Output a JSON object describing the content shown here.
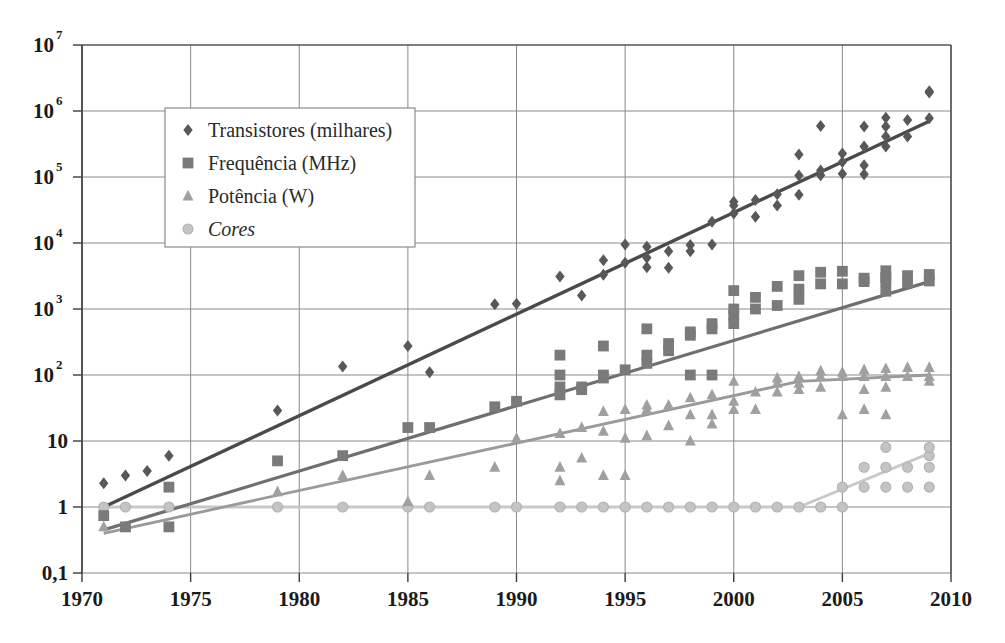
{
  "chart_data": {
    "type": "scatter",
    "title": "",
    "subtitle": "",
    "xlabel": "",
    "ylabel": "",
    "grid": true,
    "xlim": [
      1970,
      2010
    ],
    "ylim": [
      0.1,
      10000000
    ],
    "yscale": "log",
    "xticks": [
      "1970",
      "1975",
      "1980",
      "1985",
      "1990",
      "1995",
      "2000",
      "2005",
      "2010"
    ],
    "xtick_values": [
      1970,
      1975,
      1980,
      1985,
      1990,
      1995,
      2000,
      2005,
      2010
    ],
    "yticks": [
      "10⁷",
      "10⁶",
      "10⁵",
      "10⁴",
      "10³",
      "10²",
      "10",
      "1",
      "0,1"
    ],
    "ytick_values": [
      10000000,
      1000000,
      100000,
      10000,
      1000,
      100,
      10,
      1,
      0.1
    ],
    "ytick_bases": [
      "10",
      "10",
      "10",
      "10",
      "10",
      "10",
      "10",
      "1",
      "0,1"
    ],
    "ytick_exponents": [
      "7",
      "6",
      "5",
      "4",
      "3",
      "2",
      "",
      "",
      ""
    ],
    "legend_position": "upper-left",
    "series": [
      {
        "name": "Transistores (milhares)",
        "marker": "diamond",
        "color": "#585858",
        "trend_color": "#4a4a4a",
        "trend": [
          [
            1971,
            1.0
          ],
          [
            2009,
            700000
          ]
        ],
        "points": [
          [
            1971,
            2.3
          ],
          [
            1972,
            3.0
          ],
          [
            1973,
            3.5
          ],
          [
            1974,
            6.0
          ],
          [
            1979,
            29
          ],
          [
            1982,
            134
          ],
          [
            1985,
            275
          ],
          [
            1986,
            110
          ],
          [
            1989,
            1180
          ],
          [
            1990,
            1200
          ],
          [
            1992,
            3100
          ],
          [
            1993,
            1600
          ],
          [
            1994,
            3300
          ],
          [
            1994,
            5500
          ],
          [
            1995,
            9500
          ],
          [
            1995,
            5000
          ],
          [
            1996,
            4300
          ],
          [
            1996,
            8800
          ],
          [
            1996,
            6000
          ],
          [
            1997,
            7500
          ],
          [
            1997,
            4200
          ],
          [
            1998,
            9300
          ],
          [
            1998,
            7500
          ],
          [
            1999,
            21000
          ],
          [
            1999,
            9500
          ],
          [
            2000,
            28000
          ],
          [
            2000,
            42000
          ],
          [
            2000,
            37000
          ],
          [
            2001,
            45000
          ],
          [
            2001,
            25000
          ],
          [
            2002,
            55000
          ],
          [
            2002,
            37000
          ],
          [
            2003,
            105000
          ],
          [
            2003,
            54000
          ],
          [
            2003,
            220000
          ],
          [
            2004,
            125000
          ],
          [
            2004,
            106000
          ],
          [
            2004,
            592000
          ],
          [
            2005,
            228000
          ],
          [
            2005,
            112000
          ],
          [
            2005,
            169000
          ],
          [
            2006,
            291000
          ],
          [
            2006,
            151000
          ],
          [
            2006,
            582000
          ],
          [
            2006,
            110000
          ],
          [
            2007,
            410000
          ],
          [
            2007,
            291000
          ],
          [
            2007,
            582000
          ],
          [
            2007,
            789000
          ],
          [
            2008,
            731000
          ],
          [
            2008,
            410000
          ],
          [
            2009,
            1900000
          ],
          [
            2009,
            2000000
          ],
          [
            2009,
            774000
          ]
        ]
      },
      {
        "name": "Frequência (MHz)",
        "marker": "square",
        "color": "#7a7a7a",
        "trend_color": "#6f6f6f",
        "trend": [
          [
            1971,
            0.45
          ],
          [
            2009,
            2600
          ]
        ],
        "points": [
          [
            1971,
            0.74
          ],
          [
            1972,
            0.5
          ],
          [
            1974,
            2.0
          ],
          [
            1974,
            0.5
          ],
          [
            1979,
            5.0
          ],
          [
            1982,
            6.0
          ],
          [
            1985,
            16
          ],
          [
            1986,
            16
          ],
          [
            1989,
            33
          ],
          [
            1990,
            40
          ],
          [
            1992,
            200
          ],
          [
            1992,
            100
          ],
          [
            1992,
            66
          ],
          [
            1992,
            50
          ],
          [
            1993,
            60
          ],
          [
            1993,
            66
          ],
          [
            1994,
            275
          ],
          [
            1994,
            100
          ],
          [
            1994,
            90
          ],
          [
            1995,
            120
          ],
          [
            1996,
            500
          ],
          [
            1996,
            200
          ],
          [
            1996,
            150
          ],
          [
            1997,
            300
          ],
          [
            1997,
            233
          ],
          [
            1998,
            450
          ],
          [
            1998,
            400
          ],
          [
            1998,
            100
          ],
          [
            1999,
            600
          ],
          [
            1999,
            500
          ],
          [
            1999,
            100
          ],
          [
            2000,
            1000
          ],
          [
            2000,
            1900
          ],
          [
            2000,
            800
          ],
          [
            2000,
            600
          ],
          [
            2001,
            1500
          ],
          [
            2001,
            1000
          ],
          [
            2002,
            2200
          ],
          [
            2002,
            1130
          ],
          [
            2003,
            3200
          ],
          [
            2003,
            2000
          ],
          [
            2003,
            1400
          ],
          [
            2004,
            3600
          ],
          [
            2004,
            2400
          ],
          [
            2005,
            3730
          ],
          [
            2005,
            2400
          ],
          [
            2006,
            2930
          ],
          [
            2006,
            2600
          ],
          [
            2007,
            3000
          ],
          [
            2007,
            2660
          ],
          [
            2007,
            3800
          ],
          [
            2007,
            1860
          ],
          [
            2008,
            3200
          ],
          [
            2008,
            2500
          ],
          [
            2009,
            3330
          ],
          [
            2009,
            2660
          ]
        ]
      },
      {
        "name": "Potência (W)",
        "marker": "triangle",
        "color": "#a0a0a0",
        "trend_color": "#9a9a9a",
        "trend": [
          [
            1971,
            0.4
          ],
          [
            2003,
            80
          ],
          [
            2009,
            100
          ]
        ],
        "points": [
          [
            1971,
            0.5
          ],
          [
            1979,
            1.7
          ],
          [
            1982,
            3.0
          ],
          [
            1985,
            1.2
          ],
          [
            1986,
            3.0
          ],
          [
            1989,
            4.0
          ],
          [
            1990,
            11
          ],
          [
            1992,
            13
          ],
          [
            1992,
            4.0
          ],
          [
            1992,
            2.5
          ],
          [
            1993,
            16
          ],
          [
            1993,
            5.5
          ],
          [
            1994,
            28
          ],
          [
            1994,
            14
          ],
          [
            1994,
            3.0
          ],
          [
            1995,
            30
          ],
          [
            1995,
            11
          ],
          [
            1995,
            3.0
          ],
          [
            1996,
            35
          ],
          [
            1996,
            30
          ],
          [
            1996,
            12
          ],
          [
            1997,
            35
          ],
          [
            1997,
            17
          ],
          [
            1998,
            45
          ],
          [
            1998,
            25
          ],
          [
            1998,
            10
          ],
          [
            1999,
            50
          ],
          [
            1999,
            25
          ],
          [
            1999,
            18
          ],
          [
            2000,
            80
          ],
          [
            2000,
            40
          ],
          [
            2000,
            30
          ],
          [
            2001,
            55
          ],
          [
            2001,
            30
          ],
          [
            2002,
            90
          ],
          [
            2002,
            75
          ],
          [
            2002,
            55
          ],
          [
            2003,
            95
          ],
          [
            2003,
            75
          ],
          [
            2003,
            60
          ],
          [
            2004,
            115
          ],
          [
            2004,
            95
          ],
          [
            2004,
            65
          ],
          [
            2005,
            110
          ],
          [
            2005,
            95
          ],
          [
            2005,
            25
          ],
          [
            2006,
            120
          ],
          [
            2006,
            95
          ],
          [
            2006,
            60
          ],
          [
            2006,
            30
          ],
          [
            2007,
            125
          ],
          [
            2007,
            95
          ],
          [
            2007,
            65
          ],
          [
            2007,
            25
          ],
          [
            2008,
            130
          ],
          [
            2008,
            95
          ],
          [
            2009,
            130
          ],
          [
            2009,
            95
          ],
          [
            2009,
            80
          ]
        ]
      },
      {
        "name": "Cores",
        "marker": "circle",
        "color": "#c4c4c4",
        "trend_color": "#c8c8c8",
        "italic": true,
        "trend": [
          [
            1971,
            1
          ],
          [
            2003,
            1
          ],
          [
            2009,
            6.5
          ]
        ],
        "points": [
          [
            1971,
            1
          ],
          [
            1972,
            1
          ],
          [
            1974,
            1
          ],
          [
            1979,
            1
          ],
          [
            1982,
            1
          ],
          [
            1985,
            1
          ],
          [
            1986,
            1
          ],
          [
            1989,
            1
          ],
          [
            1990,
            1
          ],
          [
            1992,
            1
          ],
          [
            1993,
            1
          ],
          [
            1994,
            1
          ],
          [
            1995,
            1
          ],
          [
            1996,
            1
          ],
          [
            1997,
            1
          ],
          [
            1998,
            1
          ],
          [
            1999,
            1
          ],
          [
            2000,
            1
          ],
          [
            2001,
            1
          ],
          [
            2002,
            1
          ],
          [
            2003,
            1
          ],
          [
            2004,
            1
          ],
          [
            2005,
            1
          ],
          [
            2005,
            2
          ],
          [
            2006,
            2
          ],
          [
            2006,
            4
          ],
          [
            2007,
            2
          ],
          [
            2007,
            4
          ],
          [
            2007,
            8
          ],
          [
            2008,
            2
          ],
          [
            2008,
            4
          ],
          [
            2009,
            2
          ],
          [
            2009,
            4
          ],
          [
            2009,
            6
          ],
          [
            2009,
            8
          ]
        ]
      }
    ]
  }
}
